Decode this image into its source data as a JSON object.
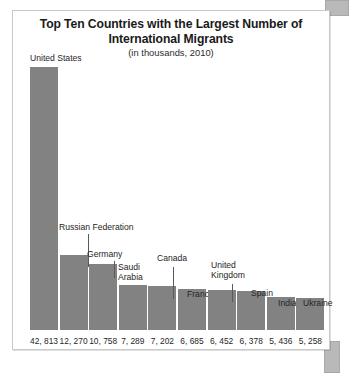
{
  "figure": {
    "title": "Top Ten Countries with the Largest Number of International Migrants",
    "title_line1": "Top Ten Countries with the Largest Number of",
    "title_line2": "International Migrants",
    "subtitle": "(in thousands, 2010)"
  },
  "colors": {
    "bar": "#828282",
    "frame": "#c9c9c9",
    "text": "#262626",
    "leader": "#5a5a5a",
    "scroll_nub": "#b9b9b9"
  },
  "chart_data": {
    "type": "bar",
    "title": "Top Ten Countries with the Largest Number of International Migrants",
    "subtitle": "(in thousands, 2010)",
    "xlabel": "",
    "ylabel": "",
    "units": "thousands",
    "year": 2010,
    "grid": false,
    "legend": false,
    "ylim": [
      0,
      42813
    ],
    "categories": [
      "United States",
      "Russian Federation",
      "Germany",
      "Saudi Arabia",
      "Canada",
      "France",
      "United Kingdom",
      "Spain",
      "India",
      "Ukraine"
    ],
    "values": [
      42813,
      12270,
      10758,
      7289,
      7202,
      6685,
      6452,
      6378,
      5436,
      5258
    ],
    "value_labels": [
      "42, 813",
      "12, 270",
      "10, 758",
      "7, 289",
      "7, 202",
      "6, 685",
      "6, 452",
      "6, 378",
      "5, 436",
      "5, 258"
    ],
    "bars": [
      {
        "category": "United States",
        "value": 42813,
        "value_label": "42, 813",
        "label_lines": [
          "United States"
        ],
        "label_left": 17,
        "label_top": 42,
        "leader": false
      },
      {
        "category": "Russian Federation",
        "value": 12270,
        "value_label": "12, 270",
        "label_lines": [
          "Russian Federation"
        ],
        "label_left": 46,
        "label_top": 211,
        "leader": true,
        "leader_left": 75,
        "leader_top": 223,
        "leader_height": 33
      },
      {
        "category": "Germany",
        "value": 10758,
        "value_label": "10, 758",
        "label_lines": [
          "Germany"
        ],
        "label_left": 74,
        "label_top": 238,
        "leader": true,
        "leader_left": 101,
        "leader_top": 250,
        "leader_height": 17
      },
      {
        "category": "Saudi Arabia",
        "value": 7289,
        "value_label": "7, 289",
        "label_lines": [
          "Saudi",
          "Arabia"
        ],
        "label_left": 105,
        "label_top": 251,
        "leader": false
      },
      {
        "category": "Canada",
        "value": 7202,
        "value_label": "7, 202",
        "label_lines": [
          "Canada"
        ],
        "label_left": 144,
        "label_top": 242,
        "leader": true,
        "leader_left": 160,
        "leader_top": 256,
        "leader_height": 32
      },
      {
        "category": "France",
        "value": 6685,
        "value_label": "6, 685",
        "label_lines": [
          "France"
        ],
        "label_left": 174,
        "label_top": 278,
        "leader": false
      },
      {
        "category": "United Kingdom",
        "value": 6452,
        "value_label": "6, 452",
        "label_lines": [
          "United",
          "Kingdom"
        ],
        "label_left": 198,
        "label_top": 249,
        "leader": true,
        "leader_left": 219,
        "leader_top": 273,
        "leader_height": 18
      },
      {
        "category": "Spain",
        "value": 6378,
        "value_label": "6, 378",
        "label_lines": [
          "Spain"
        ],
        "label_left": 238,
        "label_top": 277,
        "leader": false
      },
      {
        "category": "India",
        "value": 5436,
        "value_label": "5, 436",
        "label_lines": [
          "India"
        ],
        "label_left": 265,
        "label_top": 287,
        "leader": false
      },
      {
        "category": "Ukraine",
        "value": 5258,
        "value_label": "5, 258",
        "label_lines": [
          "Ukraine"
        ],
        "label_left": 290,
        "label_top": 287,
        "leader": false
      }
    ]
  }
}
